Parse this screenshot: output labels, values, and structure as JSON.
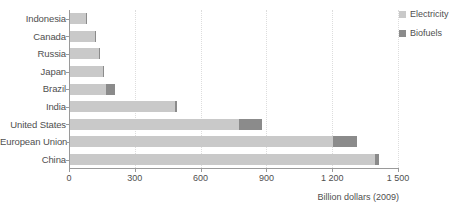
{
  "chart_data": {
    "type": "bar",
    "orientation": "horizontal",
    "stacked": true,
    "title": "",
    "subtitle": "",
    "xlabel": "Billion dollars (2009)",
    "ylabel": "",
    "xlim": [
      0,
      1500
    ],
    "xticks": [
      0,
      300,
      600,
      900,
      1200,
      1500
    ],
    "xtick_labels": [
      "0",
      "300",
      "600",
      "900",
      "1 200",
      "1 500"
    ],
    "grid": "vertical-dotted",
    "legend_position": "top-right",
    "categories": [
      "Indonesia",
      "Canada",
      "Russia",
      "Japan",
      "Brazil",
      "India",
      "United States",
      "European Union",
      "China"
    ],
    "series": [
      {
        "name": "Electricity",
        "color": "#c9c9c9",
        "values": [
          72,
          112,
          130,
          150,
          165,
          480,
          770,
          1200,
          1390
        ]
      },
      {
        "name": "Biofuels",
        "color": "#8b8b8b",
        "values": [
          3,
          8,
          5,
          3,
          40,
          10,
          105,
          110,
          20
        ]
      }
    ],
    "totals": [
      75,
      120,
      135,
      153,
      205,
      490,
      875,
      1310,
      1410
    ]
  },
  "legend": {
    "items": [
      {
        "label": "Electricity",
        "color": "#c9c9c9"
      },
      {
        "label": "Biofuels",
        "color": "#8b8b8b"
      }
    ]
  },
  "axis": {
    "x_title": "Billion dollars (2009)"
  }
}
